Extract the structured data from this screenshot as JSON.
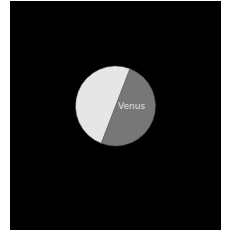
{
  "chart_data": {
    "type": "pie",
    "title": "",
    "slices": [
      {
        "label": "Venus",
        "value": 50,
        "color": "#777777",
        "label_color": "#e0e0e0",
        "label_visible": true
      },
      {
        "label": "",
        "value": 50,
        "color": "#e6e6e6",
        "label_visible": false
      }
    ],
    "start_angle_deg": 21,
    "background": "#000000",
    "legend": "none"
  }
}
